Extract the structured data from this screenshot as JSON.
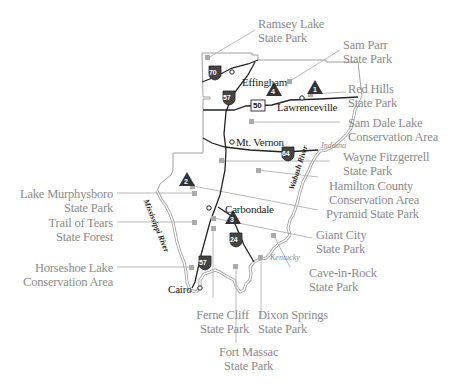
{
  "map": {
    "title": "Southern Illinois State Parks Map",
    "colors": {
      "background": "#ffffff",
      "border": "#999999",
      "road": "#222222",
      "label": "#8a8a8a",
      "leader_line": "#aaaaaa",
      "marker": "#a8a8a8",
      "campsite_marker": "#333333"
    },
    "parks": [
      {
        "id": "ramsey-lake",
        "line1": "Ramsey Lake",
        "line2": "State Park"
      },
      {
        "id": "sam-parr",
        "line1": "Sam Parr",
        "line2": "State Park"
      },
      {
        "id": "red-hills",
        "line1": "Red Hills",
        "line2": "State Park"
      },
      {
        "id": "sam-dale-lake",
        "line1": "Sam Dale Lake",
        "line2": "Conservation Area"
      },
      {
        "id": "wayne-fitzgerrell",
        "line1": "Wayne Fitzgerrell",
        "line2": "State Park"
      },
      {
        "id": "hamilton-county",
        "line1": "Hamilton County",
        "line2": "Conservation Area"
      },
      {
        "id": "pyramid",
        "line1": "Pyramid State Park",
        "line2": ""
      },
      {
        "id": "giant-city",
        "line1": "Giant City",
        "line2": "State Park"
      },
      {
        "id": "cave-in-rock",
        "line1": "Cave-in-Rock",
        "line2": "State Park"
      },
      {
        "id": "dixon-springs",
        "line1": "Dixon Springs",
        "line2": "State Park"
      },
      {
        "id": "fort-massac",
        "line1": "Fort Massac",
        "line2": "State Park"
      },
      {
        "id": "ferne-cliff",
        "line1": "Ferne Cliff",
        "line2": "State Park"
      },
      {
        "id": "horseshoe-lake",
        "line1": "Horseshoe Lake",
        "line2": "Conservation Area"
      },
      {
        "id": "trail-of-tears",
        "line1": "Trail of Tears",
        "line2": "State Forest"
      },
      {
        "id": "lake-murphysboro",
        "line1": "Lake Murphysboro",
        "line2": "State Park"
      }
    ],
    "cities": [
      {
        "id": "effingham",
        "name": "Effingham"
      },
      {
        "id": "lawrenceville",
        "name": "Lawrenceville"
      },
      {
        "id": "mt-vernon",
        "name": "Mt. Vernon"
      },
      {
        "id": "carbondale",
        "name": "Carbondale"
      },
      {
        "id": "cairo",
        "name": "Cairo"
      }
    ],
    "highways": [
      {
        "id": "i70",
        "number": "70",
        "type": "interstate"
      },
      {
        "id": "i57-north",
        "number": "57",
        "type": "interstate"
      },
      {
        "id": "i64",
        "number": "64",
        "type": "interstate"
      },
      {
        "id": "i24",
        "number": "24",
        "type": "interstate"
      },
      {
        "id": "i57-south",
        "number": "57",
        "type": "interstate"
      },
      {
        "id": "us50",
        "number": "50",
        "type": "us-route"
      }
    ],
    "campsites": [
      {
        "id": "campsite-1",
        "number": "1"
      },
      {
        "id": "campsite-2",
        "number": "2"
      },
      {
        "id": "campsite-3",
        "number": "3"
      },
      {
        "id": "campsite-4",
        "number": "4"
      }
    ],
    "regions": [
      {
        "id": "indiana",
        "name": "Indiana"
      },
      {
        "id": "kentucky",
        "name": "Kentucky"
      }
    ],
    "rivers": [
      {
        "id": "wabash",
        "name": "Wabash River"
      },
      {
        "id": "mississippi",
        "name": "Mississippi River"
      }
    ]
  }
}
